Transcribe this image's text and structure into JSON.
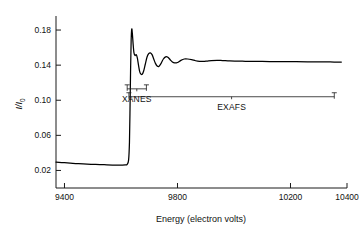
{
  "chart_data": {
    "type": "line",
    "title": "",
    "xlabel": "Energy (electron volts)",
    "ylabel": "μ/I₀",
    "ylabel_main": "I/I",
    "ylabel_sub": "0",
    "xlim": [
      9370,
      10400
    ],
    "ylim": [
      0.0,
      0.196
    ],
    "xticks": [
      9400,
      9800,
      10200,
      10400
    ],
    "xtick_labels": [
      "9400",
      "9800",
      "10200",
      "10400"
    ],
    "yticks": [
      0.02,
      0.06,
      0.1,
      0.14,
      0.18
    ],
    "ytick_labels": [
      "0.02",
      "0.06",
      "0.10",
      "0.14",
      "0.18"
    ],
    "grid": false,
    "legend": "none",
    "series": [
      {
        "name": "X-ray absorption spectrum",
        "color": "#000000",
        "x": [
          9370,
          9390,
          9400,
          9420,
          9450,
          9480,
          9510,
          9540,
          9570,
          9590,
          9605,
          9615,
          9622,
          9627,
          9630,
          9632,
          9634,
          9636,
          9638,
          9640,
          9643,
          9646,
          9650,
          9654,
          9658,
          9662,
          9666,
          9670,
          9675,
          9680,
          9686,
          9692,
          9698,
          9704,
          9710,
          9716,
          9722,
          9728,
          9734,
          9742,
          9750,
          9758,
          9766,
          9774,
          9782,
          9790,
          9800,
          9812,
          9824,
          9836,
          9850,
          9864,
          9878,
          9892,
          9906,
          9920,
          9940,
          9960,
          9985,
          10010,
          10040,
          10070,
          10100,
          10140,
          10180,
          10220,
          10260,
          10300,
          10340,
          10380
        ],
        "y": [
          0.0295,
          0.029,
          0.0288,
          0.0283,
          0.0277,
          0.0272,
          0.0268,
          0.0265,
          0.0262,
          0.0261,
          0.0261,
          0.0263,
          0.027,
          0.032,
          0.052,
          0.09,
          0.135,
          0.168,
          0.181,
          0.177,
          0.164,
          0.154,
          0.151,
          0.152,
          0.148,
          0.14,
          0.133,
          0.13,
          0.1295,
          0.133,
          0.141,
          0.149,
          0.153,
          0.154,
          0.152,
          0.147,
          0.142,
          0.139,
          0.1385,
          0.142,
          0.147,
          0.1495,
          0.149,
          0.1462,
          0.1436,
          0.1425,
          0.143,
          0.1455,
          0.147,
          0.147,
          0.1462,
          0.145,
          0.1443,
          0.1442,
          0.1447,
          0.1452,
          0.1455,
          0.1452,
          0.1448,
          0.1446,
          0.1444,
          0.1443,
          0.1442,
          0.1441,
          0.144,
          0.1439,
          0.1438,
          0.1437,
          0.1436,
          0.1435
        ]
      }
    ],
    "annotations": [
      {
        "name": "xanes",
        "label": "XANES",
        "x_start": 9622,
        "x_end": 9690,
        "bracket_y": 0.113
      },
      {
        "name": "exafs",
        "label": "EXAFS",
        "x_start": 9628,
        "x_end": 10355,
        "bracket_y": 0.104
      }
    ]
  }
}
